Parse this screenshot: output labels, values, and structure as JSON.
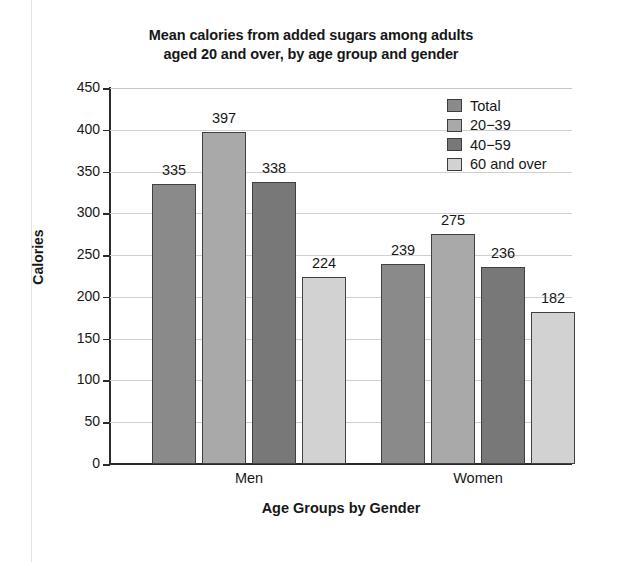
{
  "chart_data": {
    "type": "bar",
    "title": "Mean calories from added sugars among adults aged 20 and over, by age group and gender",
    "title_line1": "Mean calories from added sugars among adults",
    "title_line2": "aged 20 and over, by age group and gender",
    "xlabel": "Age Groups by Gender",
    "ylabel": "Calories",
    "categories": [
      "Men",
      "Women"
    ],
    "ylim": [
      0,
      450
    ],
    "ytick_labels": [
      "450",
      "400",
      "350",
      "300",
      "250",
      "200",
      "150",
      "100",
      "50",
      "0"
    ],
    "ytick_values": [
      450,
      400,
      350,
      300,
      250,
      200,
      150,
      100,
      50,
      0
    ],
    "grid": "horizontal",
    "legend_position": "top-right",
    "series": [
      {
        "name": "Total",
        "values": [
          335,
          239
        ],
        "color": "#8a8a8a"
      },
      {
        "name": "20−39",
        "values": [
          397,
          275
        ],
        "color": "#a9a9a9"
      },
      {
        "name": "40−59",
        "values": [
          338,
          236
        ],
        "color": "#787878"
      },
      {
        "name": "60 and over",
        "values": [
          224,
          182
        ],
        "color": "#d2d2d2"
      }
    ],
    "bars": [
      {
        "group": "Men",
        "series": "Total",
        "value": 335,
        "label": "335"
      },
      {
        "group": "Men",
        "series": "20−39",
        "value": 397,
        "label": "397"
      },
      {
        "group": "Men",
        "series": "40−59",
        "value": 338,
        "label": "338"
      },
      {
        "group": "Men",
        "series": "60 and over",
        "value": 224,
        "label": "224"
      },
      {
        "group": "Women",
        "series": "Total",
        "value": 239,
        "label": "239"
      },
      {
        "group": "Women",
        "series": "20−39",
        "value": 275,
        "label": "275"
      },
      {
        "group": "Women",
        "series": "40−59",
        "value": 236,
        "label": "236"
      },
      {
        "group": "Women",
        "series": "60 and over",
        "value": 182,
        "label": "182"
      }
    ]
  }
}
